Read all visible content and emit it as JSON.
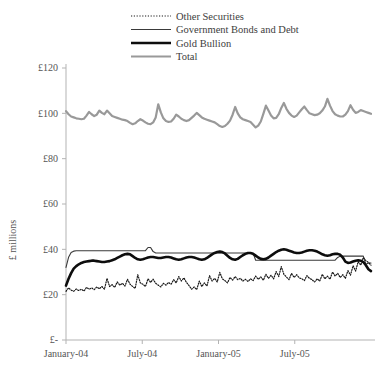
{
  "chart_data": {
    "type": "line",
    "title": "",
    "xlabel": "",
    "ylabel": "£ millions",
    "ylim": [
      0,
      120
    ],
    "yticks": [
      0,
      20,
      40,
      60,
      80,
      100,
      120
    ],
    "ytick_labels": [
      "£-",
      "£20",
      "£40",
      "£60",
      "£80",
      "£100",
      "£120"
    ],
    "xticks": [
      0,
      6,
      12,
      18
    ],
    "xtick_labels": [
      "January-04",
      "July-04",
      "January-05",
      "July-05"
    ],
    "x_range": [
      0,
      24
    ],
    "grid": false,
    "legend_position": "top-center",
    "legend": [
      {
        "name": "Other Securities",
        "style": "dotted",
        "color": "#1a1a1a",
        "width": 1.2
      },
      {
        "name": "Government Bonds and Debt",
        "style": "solid",
        "color": "#3a3a3a",
        "width": 1.1
      },
      {
        "name": "Gold Bullion",
        "style": "solid",
        "color": "#0d0d0d",
        "width": 2.6
      },
      {
        "name": "Total",
        "style": "solid",
        "color": "#999999",
        "width": 2.2
      }
    ],
    "series": [
      {
        "name": "Other Securities",
        "style": "dotted",
        "color": "#1a1a1a",
        "width": 1.2,
        "values": [
          21.5,
          23.0,
          22.0,
          21.5,
          22.5,
          21.8,
          22.4,
          21.6,
          23.2,
          22.4,
          23.0,
          22.2,
          23.4,
          22.6,
          23.6,
          22.4,
          27.2,
          23.6,
          24.4,
          23.2,
          25.6,
          24.2,
          25.0,
          23.8,
          26.8,
          24.6,
          23.6,
          22.8,
          28.8,
          25.2,
          24.6,
          23.6,
          27.0,
          25.4,
          26.8,
          25.0,
          24.2,
          23.4,
          25.0,
          24.2,
          25.4,
          24.6,
          26.6,
          25.2,
          28.0,
          26.0,
          27.4,
          25.4,
          24.0,
          22.4,
          23.4,
          22.2,
          26.0,
          23.6,
          25.2,
          23.8,
          28.4,
          26.0,
          27.2,
          25.6,
          29.8,
          27.0,
          26.2,
          25.2,
          27.6,
          26.4,
          28.0,
          26.6,
          27.2,
          26.0,
          26.8,
          25.8,
          27.0,
          26.2,
          28.2,
          26.8,
          27.8,
          26.4,
          29.0,
          27.2,
          28.6,
          27.0,
          30.2,
          28.0,
          32.4,
          29.0,
          27.8,
          26.6,
          29.4,
          27.6,
          28.8,
          27.4,
          27.0,
          26.2,
          28.4,
          27.2,
          26.6,
          25.6,
          27.0,
          26.0,
          29.0,
          27.0,
          28.2,
          26.8,
          30.0,
          28.2,
          29.4,
          27.6,
          28.8,
          27.2,
          30.6,
          28.6,
          32.8,
          30.4,
          34.6,
          33.0,
          36.4,
          35.0,
          34.2,
          33.0
        ]
      },
      {
        "name": "Government Bonds and Debt",
        "style": "solid",
        "color": "#3a3a3a",
        "width": 1.1,
        "values": [
          32.0,
          36.5,
          38.6,
          39.2,
          39.4,
          39.4,
          39.4,
          39.4,
          39.4,
          39.4,
          39.4,
          39.4,
          39.4,
          39.4,
          39.4,
          39.4,
          39.4,
          39.4,
          39.4,
          39.4,
          39.4,
          39.4,
          39.4,
          39.4,
          39.4,
          39.4,
          39.4,
          39.4,
          39.4,
          39.4,
          39.4,
          39.4,
          40.8,
          40.8,
          39.0,
          38.4,
          38.4,
          38.4,
          38.4,
          38.4,
          38.4,
          38.4,
          38.4,
          38.4,
          38.4,
          38.4,
          38.4,
          38.4,
          38.4,
          38.4,
          38.4,
          38.4,
          38.4,
          38.4,
          38.4,
          38.4,
          38.4,
          38.4,
          38.4,
          38.4,
          38.4,
          38.4,
          38.4,
          38.4,
          38.4,
          38.4,
          38.4,
          38.4,
          38.4,
          38.4,
          38.4,
          38.4,
          38.4,
          38.4,
          35.2,
          35.2,
          35.2,
          35.2,
          35.2,
          35.2,
          35.2,
          35.2,
          35.2,
          35.2,
          35.2,
          35.2,
          35.2,
          35.2,
          35.2,
          35.2,
          35.2,
          35.2,
          35.2,
          35.2,
          35.2,
          35.2,
          35.2,
          35.2,
          35.2,
          35.2,
          35.2,
          35.2,
          35.2,
          35.2,
          35.2,
          35.2,
          36.4,
          37.0,
          37.0,
          37.0,
          37.0,
          37.0,
          37.0,
          37.0,
          37.0,
          37.0,
          37.0,
          33.4,
          34.0,
          34.0
        ]
      },
      {
        "name": "Gold Bullion",
        "style": "solid",
        "color": "#0d0d0d",
        "width": 2.6,
        "values": [
          24.0,
          27.0,
          29.5,
          31.5,
          32.6,
          33.4,
          34.0,
          34.4,
          34.6,
          34.8,
          35.0,
          35.0,
          34.8,
          34.6,
          34.4,
          34.4,
          34.6,
          34.8,
          35.2,
          35.6,
          36.2,
          36.8,
          37.4,
          37.8,
          38.0,
          37.8,
          37.0,
          36.2,
          35.6,
          35.4,
          35.6,
          36.0,
          36.4,
          36.6,
          36.6,
          36.4,
          36.2,
          36.2,
          36.4,
          36.6,
          36.6,
          36.4,
          36.0,
          35.6,
          35.4,
          35.6,
          36.0,
          36.4,
          36.6,
          36.6,
          36.4,
          36.0,
          35.6,
          35.4,
          35.6,
          36.2,
          37.0,
          37.8,
          38.4,
          38.8,
          39.0,
          38.8,
          38.2,
          37.2,
          36.2,
          35.6,
          35.4,
          35.8,
          36.6,
          37.4,
          38.0,
          38.4,
          38.4,
          38.0,
          37.2,
          36.4,
          35.8,
          35.6,
          35.8,
          36.4,
          37.2,
          38.0,
          38.8,
          39.4,
          39.8,
          40.0,
          39.8,
          39.4,
          39.0,
          38.6,
          38.4,
          38.4,
          38.6,
          39.0,
          39.4,
          39.6,
          39.6,
          39.4,
          39.0,
          38.4,
          37.8,
          37.4,
          37.2,
          37.4,
          37.8,
          38.0,
          38.0,
          37.6,
          36.4,
          34.6,
          34.0,
          34.2,
          34.6,
          35.0,
          35.2,
          35.0,
          34.4,
          33.0,
          31.2,
          30.4
        ]
      },
      {
        "name": "Total",
        "style": "solid",
        "color": "#999999",
        "width": 2.2,
        "values": [
          101.0,
          99.6,
          98.6,
          98.2,
          97.8,
          97.6,
          97.4,
          97.6,
          99.0,
          100.6,
          99.6,
          98.8,
          99.4,
          101.2,
          100.2,
          99.6,
          101.2,
          100.0,
          98.8,
          98.4,
          98.0,
          97.6,
          97.2,
          97.0,
          96.6,
          95.8,
          95.2,
          95.6,
          96.6,
          97.4,
          96.8,
          96.0,
          95.4,
          95.2,
          96.0,
          98.2,
          104.0,
          100.4,
          97.8,
          96.6,
          96.2,
          96.4,
          97.6,
          99.4,
          98.6,
          97.6,
          97.0,
          96.6,
          97.0,
          98.0,
          99.0,
          100.2,
          99.2,
          98.2,
          97.6,
          97.2,
          96.8,
          96.4,
          96.0,
          95.2,
          94.4,
          94.0,
          94.4,
          95.4,
          96.8,
          99.4,
          102.8,
          100.0,
          98.2,
          97.4,
          97.0,
          96.6,
          96.2,
          95.0,
          93.8,
          94.6,
          96.4,
          99.8,
          103.4,
          101.2,
          99.0,
          97.8,
          98.0,
          99.6,
          102.4,
          104.6,
          102.0,
          100.2,
          99.0,
          98.4,
          99.0,
          100.4,
          101.8,
          103.0,
          101.4,
          100.0,
          99.6,
          99.2,
          99.4,
          100.0,
          101.2,
          103.0,
          106.4,
          103.4,
          101.0,
          99.6,
          99.0,
          98.6,
          98.6,
          99.4,
          101.0,
          103.6,
          101.6,
          100.2,
          100.6,
          101.4,
          101.0,
          100.6,
          100.2,
          99.8
        ]
      }
    ]
  }
}
